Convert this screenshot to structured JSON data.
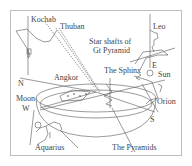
{
  "diagram": {
    "labels": {
      "kochab": "Kochab",
      "thuban": "Thuban",
      "star_shafts_line1": "Star shafts of",
      "star_shafts_line2": "Gt Pyramid",
      "leo": "Leo",
      "north": "N",
      "angkor": "Angkor",
      "sphinx": "The Sphinx",
      "east": "E",
      "sun": "Sun",
      "moon": "Moon",
      "west": "W",
      "orion": "Orion",
      "south": "S",
      "aquarius": "Aquarius",
      "pyramids": "The Pyramids"
    },
    "colors": {
      "line": "#555555",
      "frame": "#bdbdbd",
      "text": "#444444"
    }
  }
}
